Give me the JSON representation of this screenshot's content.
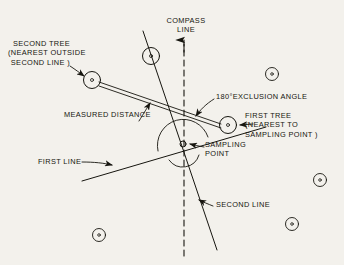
{
  "figure": {
    "background_color": "#f3f1ec",
    "ink_color": "#16150f"
  },
  "labels": {
    "compass_line": "COMPASS\nLINE",
    "second_tree": "SECOND TREE\n(NEAREST OUTSIDE\nSECOND LINE )",
    "measured_distance": "MEASURED DISTANCE",
    "exclusion_angle": "180°EXCLUSION ANGLE",
    "first_tree": "FIRST TREE\n(NEAREST TO\nSAMPLING POINT )",
    "sampling_point": "SAMPLING\nPOINT",
    "first_line": "FIRST LINE",
    "second_line": "SECOND LINE"
  },
  "geometry": {
    "sampling_point": {
      "x": 183,
      "y": 144
    },
    "first_tree": {
      "x": 228,
      "y": 125,
      "r": 8.5
    },
    "second_tree": {
      "x": 92,
      "y": 80,
      "r": 8.5
    },
    "compass_line": {
      "x": 184,
      "y_top": 38,
      "y_bottom": 256,
      "dashed": true,
      "arrow": "up"
    },
    "first_line": {
      "x1": 82,
      "y1": 181,
      "x2": 265,
      "y2": 127
    },
    "second_line": {
      "x1": 143,
      "y1": 31,
      "x2": 217,
      "y2": 250
    },
    "measured_distance_band": {
      "from": "second_tree",
      "to": "first_tree"
    },
    "exclusion_arc": {
      "cx": 183,
      "cy": 144,
      "r": 26
    }
  },
  "trees": [
    {
      "name": "second-tree",
      "x": 92,
      "y": 80,
      "r": 8.5,
      "labelled": true
    },
    {
      "name": "first-tree",
      "x": 228,
      "y": 125,
      "r": 8.5,
      "labelled": true
    },
    {
      "name": "tree-on-second-line",
      "x": 151,
      "y": 56,
      "r": 8.5,
      "labelled": false
    },
    {
      "name": "tree-upper-right",
      "x": 272,
      "y": 74,
      "r": 6.5,
      "labelled": false
    },
    {
      "name": "tree-right",
      "x": 320,
      "y": 180,
      "r": 6.5,
      "labelled": false
    },
    {
      "name": "tree-lower-right",
      "x": 292,
      "y": 224,
      "r": 6.5,
      "labelled": false
    },
    {
      "name": "tree-lower-left",
      "x": 99,
      "y": 235,
      "r": 6.5,
      "labelled": false
    }
  ],
  "leaders": [
    {
      "name": "second-tree-leader",
      "from": [
        74,
        68
      ],
      "to": [
        85,
        76
      ]
    },
    {
      "name": "measured-distance-leader",
      "from": [
        140,
        120
      ],
      "to": [
        150,
        104
      ]
    },
    {
      "name": "exclusion-angle-leader",
      "from": [
        212,
        97
      ],
      "to": [
        196,
        116
      ]
    },
    {
      "name": "first-tree-leader",
      "from": [
        252,
        125
      ],
      "to": [
        239,
        125
      ]
    },
    {
      "name": "sampling-point-leader",
      "from": [
        203,
        146
      ],
      "to": [
        190,
        143
      ]
    },
    {
      "name": "first-line-leader",
      "from": [
        82,
        162
      ],
      "to": [
        113,
        165
      ]
    },
    {
      "name": "second-line-leader",
      "from": [
        212,
        205
      ],
      "to": [
        199,
        200
      ]
    }
  ]
}
